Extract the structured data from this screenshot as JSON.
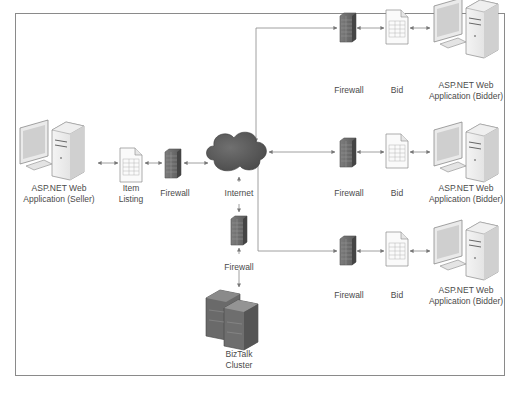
{
  "diagram": {
    "type": "network architecture",
    "background": "#ffffff",
    "frame_color": "#8a8a8a",
    "line_color": "#888888",
    "nodes": {
      "seller": {
        "label": "ASP.NET Web\nApplication (Seller)",
        "icon": "desktop-computer-icon"
      },
      "item_listing": {
        "label": "Item\nListing",
        "icon": "document-icon"
      },
      "seller_firewall": {
        "label": "Firewall",
        "icon": "firewall-icon"
      },
      "internet": {
        "label": "Internet",
        "icon": "cloud-icon"
      },
      "biztalk_firewall": {
        "label": "Firewall",
        "icon": "firewall-icon"
      },
      "biztalk": {
        "label": "BizTalk\nCluster",
        "icon": "server-cluster-icon"
      },
      "bidders": [
        {
          "firewall_label": "Firewall",
          "bid_label": "Bid",
          "app_label": "ASP.NET Web\nApplication (Bidder)"
        },
        {
          "firewall_label": "Firewall",
          "bid_label": "Bid",
          "app_label": "ASP.NET Web\nApplication (Bidder)"
        },
        {
          "firewall_label": "Firewall",
          "bid_label": "Bid",
          "app_label": "ASP.NET Web\nApplication (Bidder)"
        }
      ]
    },
    "edges": [
      [
        "seller",
        "item_listing"
      ],
      [
        "item_listing",
        "seller_firewall"
      ],
      [
        "seller_firewall",
        "internet"
      ],
      [
        "internet",
        "biztalk_firewall"
      ],
      [
        "biztalk_firewall",
        "biztalk"
      ],
      [
        "internet",
        "bidder_1_firewall"
      ],
      [
        "internet",
        "bidder_2_firewall"
      ],
      [
        "internet",
        "bidder_3_firewall"
      ],
      [
        "bidder_firewall",
        "bid"
      ],
      [
        "bid",
        "bidder_app"
      ]
    ]
  }
}
